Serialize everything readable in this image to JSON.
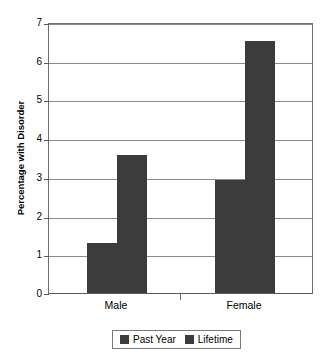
{
  "chart_data": {
    "type": "bar",
    "title": "",
    "xlabel": "",
    "ylabel": "Percentage with Disorder",
    "categories": [
      "Male",
      "Female"
    ],
    "series": [
      {
        "name": "Past Year",
        "values": [
          1.3,
          2.95
        ],
        "color": "#3c3c3c"
      },
      {
        "name": "Lifetime",
        "values": [
          3.6,
          6.55
        ],
        "color": "#3c3c3c"
      }
    ],
    "ylim": [
      0,
      7
    ],
    "ytick_labels": [
      "7",
      "6",
      "5",
      "4",
      "3",
      "2",
      "1",
      "0"
    ],
    "ytick_values": [
      7,
      6,
      5,
      4,
      3,
      2,
      1,
      0
    ],
    "grid": "horizontal",
    "legend_position": "bottom",
    "legend_entries": [
      "Past Year",
      "Lifetime"
    ]
  },
  "axis": {
    "y_title": "Percentage with Disorder",
    "y_tick_7": "7",
    "y_tick_6": "6",
    "y_tick_5": "5",
    "y_tick_4": "4",
    "y_tick_3": "3",
    "y_tick_2": "2",
    "y_tick_1": "1",
    "y_tick_0": "0",
    "x_cat_0": "Male",
    "x_cat_1": "Female"
  },
  "legend": {
    "items": [
      {
        "label": "Past Year"
      },
      {
        "label": "Lifetime"
      }
    ]
  },
  "colors": {
    "bar": "#3c3c3c",
    "gridline": "#8c8c8c",
    "axis": "#6e6e6e",
    "background": "#ffffff"
  }
}
